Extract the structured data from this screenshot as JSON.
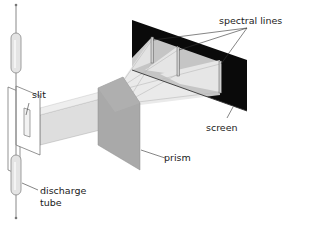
{
  "diagram": {
    "labels": {
      "spectral_lines": "spectral lines",
      "slit": "slit",
      "screen": "screen",
      "prism": "prism",
      "discharge_tube_line1": "discharge",
      "discharge_tube_line2": "tube"
    },
    "components": [
      "discharge tube",
      "slit",
      "light beam",
      "prism",
      "dispersed rays",
      "screen",
      "spectral lines"
    ],
    "colors": {
      "screen": "#0a0a0a",
      "prism_face": "#a9a9a9",
      "prism_side": "#bdbdbd",
      "beam": "#dcdcdc",
      "tube_fill": "#e4e4e4",
      "outline": "#777777",
      "leader": "#333333"
    }
  }
}
